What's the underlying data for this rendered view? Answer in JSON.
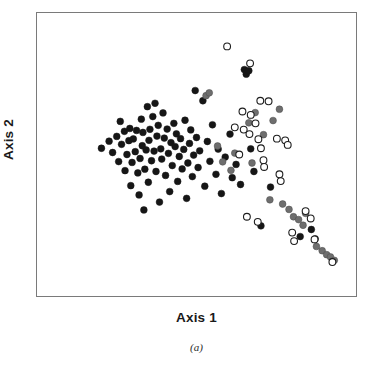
{
  "figure": {
    "caption": "(a)",
    "background": "#ffffff",
    "frame_color": "#7a7a7a"
  },
  "chart_data": {
    "type": "scatter",
    "title": "",
    "subtitle": "",
    "xlabel": "Axis 1",
    "ylabel": "Axis 2",
    "xlim": [
      0,
      100
    ],
    "ylim": [
      0,
      100
    ],
    "grid": false,
    "axis_ticks": false,
    "legend": null,
    "legend_position": "none",
    "annotations": [
      "(a)"
    ],
    "marker_radius": 3.4,
    "series": [
      {
        "name": "filled-black",
        "marker": "circle-filled",
        "color": "#161616",
        "edge_color": "#161616",
        "points": [
          [
            20.2,
            52.2
          ],
          [
            22.6,
            54.7
          ],
          [
            23.7,
            50.7
          ],
          [
            25.0,
            56.4
          ],
          [
            25.6,
            47.5
          ],
          [
            26.1,
            61.7
          ],
          [
            26.5,
            53.6
          ],
          [
            27.4,
            58.2
          ],
          [
            27.6,
            44.3
          ],
          [
            28.2,
            50.0
          ],
          [
            28.8,
            54.9
          ],
          [
            29.1,
            59.2
          ],
          [
            29.4,
            39.0
          ],
          [
            29.8,
            47.2
          ],
          [
            30.2,
            55.5
          ],
          [
            30.8,
            51.0
          ],
          [
            31.2,
            58.5
          ],
          [
            31.6,
            43.5
          ],
          [
            32.0,
            35.7
          ],
          [
            32.3,
            48.6
          ],
          [
            32.7,
            62.5
          ],
          [
            33.0,
            53.1
          ],
          [
            33.2,
            57.8
          ],
          [
            33.5,
            30.4
          ],
          [
            33.8,
            44.8
          ],
          [
            34.2,
            51.6
          ],
          [
            34.6,
            66.9
          ],
          [
            34.9,
            40.2
          ],
          [
            35.1,
            55.0
          ],
          [
            35.4,
            58.9
          ],
          [
            35.9,
            47.8
          ],
          [
            36.3,
            63.4
          ],
          [
            36.7,
            51.2
          ],
          [
            37.0,
            68.1
          ],
          [
            37.3,
            44.0
          ],
          [
            37.6,
            56.5
          ],
          [
            38.0,
            60.3
          ],
          [
            38.4,
            33.2
          ],
          [
            38.8,
            52.0
          ],
          [
            39.1,
            48.4
          ],
          [
            39.5,
            64.7
          ],
          [
            39.9,
            55.8
          ],
          [
            40.3,
            42.6
          ],
          [
            40.8,
            59.0
          ],
          [
            41.2,
            50.4
          ],
          [
            41.6,
            36.9
          ],
          [
            42.0,
            54.2
          ],
          [
            42.4,
            46.1
          ],
          [
            42.9,
            61.0
          ],
          [
            43.3,
            52.8
          ],
          [
            43.7,
            57.3
          ],
          [
            44.1,
            40.5
          ],
          [
            44.6,
            49.3
          ],
          [
            45.0,
            55.6
          ],
          [
            45.5,
            44.9
          ],
          [
            46.0,
            51.8
          ],
          [
            46.4,
            62.1
          ],
          [
            46.9,
            34.5
          ],
          [
            47.3,
            47.0
          ],
          [
            47.8,
            53.9
          ],
          [
            48.2,
            58.7
          ],
          [
            48.7,
            42.2
          ],
          [
            49.1,
            49.8
          ],
          [
            49.6,
            72.6
          ],
          [
            50.0,
            56.0
          ],
          [
            50.5,
            45.4
          ],
          [
            51.0,
            51.3
          ],
          [
            52.0,
            69.0
          ],
          [
            52.6,
            38.8
          ],
          [
            53.4,
            54.6
          ],
          [
            54.2,
            47.6
          ],
          [
            55.0,
            60.5
          ],
          [
            56.1,
            43.0
          ],
          [
            56.8,
            51.9
          ],
          [
            57.8,
            36.2
          ],
          [
            59.0,
            49.1
          ],
          [
            60.5,
            57.2
          ],
          [
            61.2,
            41.8
          ],
          [
            62.4,
            46.5
          ],
          [
            63.8,
            39.4
          ],
          [
            65.0,
            80.0
          ],
          [
            65.6,
            78.4
          ],
          [
            66.4,
            79.6
          ],
          [
            67.0,
            52.0
          ],
          [
            68.0,
            44.0
          ],
          [
            70.2,
            24.8
          ],
          [
            73.2,
            38.5
          ],
          [
            82.5,
            21.0
          ],
          [
            86.0,
            23.5
          ],
          [
            87.2,
            20.2
          ]
        ]
      },
      {
        "name": "gray-filled",
        "marker": "circle-filled",
        "color": "#6e6e6e",
        "edge_color": "#4a4a4a",
        "points": [
          [
            53.0,
            70.8
          ],
          [
            56.6,
            53.0
          ],
          [
            58.2,
            47.4
          ],
          [
            62.0,
            50.5
          ],
          [
            66.4,
            61.2
          ],
          [
            68.4,
            64.8
          ],
          [
            71.0,
            57.0
          ],
          [
            73.0,
            34.0
          ],
          [
            74.0,
            62.0
          ],
          [
            76.0,
            66.0
          ],
          [
            79.0,
            30.6
          ],
          [
            80.4,
            28.0
          ],
          [
            82.0,
            27.0
          ],
          [
            83.4,
            25.0
          ],
          [
            84.2,
            29.2
          ],
          [
            87.6,
            17.5
          ],
          [
            89.4,
            16.0
          ],
          [
            90.8,
            14.6
          ],
          [
            92.0,
            13.8
          ],
          [
            93.2,
            12.6
          ],
          [
            77.0,
            32.5
          ],
          [
            60.8,
            44.4
          ],
          [
            54.0,
            71.8
          ],
          [
            67.4,
            47.0
          ]
        ]
      },
      {
        "name": "open-circle",
        "marker": "circle-open",
        "color": "#ffffff",
        "edge_color": "#1d1d1d",
        "points": [
          [
            59.6,
            88.2
          ],
          [
            66.8,
            82.2
          ],
          [
            70.0,
            69.0
          ],
          [
            72.6,
            68.8
          ],
          [
            64.4,
            65.2
          ],
          [
            67.0,
            64.0
          ],
          [
            68.5,
            61.0
          ],
          [
            62.0,
            59.6
          ],
          [
            64.8,
            58.8
          ],
          [
            66.6,
            57.2
          ],
          [
            69.4,
            55.4
          ],
          [
            70.2,
            52.2
          ],
          [
            75.2,
            55.6
          ],
          [
            77.8,
            55.0
          ],
          [
            78.6,
            53.4
          ],
          [
            71.0,
            48.0
          ],
          [
            71.2,
            45.6
          ],
          [
            76.0,
            43.0
          ],
          [
            76.4,
            40.6
          ],
          [
            65.8,
            28.0
          ],
          [
            69.2,
            26.2
          ],
          [
            84.2,
            30.0
          ],
          [
            85.8,
            27.4
          ],
          [
            80.0,
            22.4
          ],
          [
            80.6,
            19.4
          ],
          [
            87.0,
            20.0
          ],
          [
            92.6,
            12.0
          ],
          [
            63.4,
            50.0
          ]
        ]
      }
    ]
  },
  "labels": {
    "x_axis": "Axis 1",
    "y_axis": "Axis 2"
  }
}
